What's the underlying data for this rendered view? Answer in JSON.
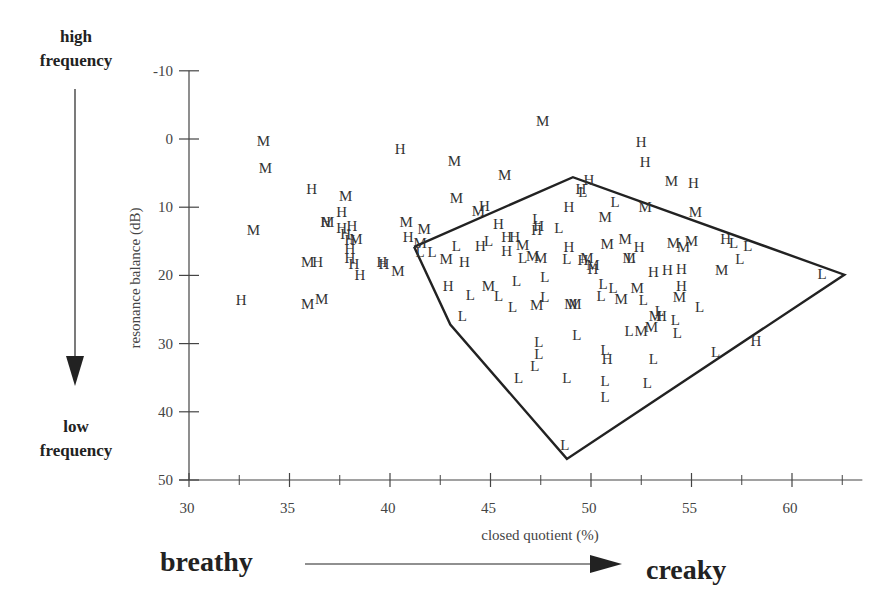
{
  "chart_data": {
    "type": "scatter",
    "title": "",
    "xlabel": "closed quotient (%)",
    "ylabel": "resonance balance (dB)",
    "xlim": [
      30,
      63.5
    ],
    "ylim": [
      -10,
      50
    ],
    "y_inverted": true,
    "grid": false,
    "x_ticks": [
      30,
      35,
      40,
      45,
      50,
      55,
      60
    ],
    "x_tick_labels": [
      "30",
      "35",
      "40",
      "45",
      "50",
      "55",
      "60"
    ],
    "x_minor_ticks": [
      32.5,
      37.5,
      42.5,
      47.5,
      52.5,
      57.5,
      62.5
    ],
    "y_ticks": [
      -10,
      0,
      10,
      20,
      30,
      40,
      50
    ],
    "y_tick_labels": [
      "-10",
      "0",
      "10",
      "20",
      "30",
      "40",
      "50"
    ],
    "marker_type": "text-glyph",
    "legend": {
      "H": "high",
      "M": "mid",
      "L": "low"
    },
    "polygon": {
      "label": "L region hull",
      "vertices": [
        [
          41.2,
          15.8
        ],
        [
          49.1,
          5.6
        ],
        [
          62.6,
          19.9
        ],
        [
          48.8,
          46.9
        ],
        [
          43.0,
          27.2
        ],
        [
          41.2,
          15.8
        ]
      ]
    },
    "series": [
      {
        "name": "H",
        "points": [
          [
            32.6,
            23.6
          ],
          [
            36.1,
            7.4
          ],
          [
            36.8,
            12.2
          ],
          [
            36.4,
            18.0
          ],
          [
            37.6,
            10.7
          ],
          [
            37.6,
            13.0
          ],
          [
            37.8,
            14.0
          ],
          [
            38.1,
            12.8
          ],
          [
            38.0,
            14.8
          ],
          [
            38.0,
            16.2
          ],
          [
            38.0,
            17.4
          ],
          [
            38.2,
            18.4
          ],
          [
            38.5,
            20.0
          ],
          [
            39.7,
            18.3
          ],
          [
            40.5,
            1.4
          ],
          [
            40.9,
            14.3
          ],
          [
            42.9,
            21.6
          ],
          [
            43.7,
            18.0
          ],
          [
            44.5,
            15.7
          ],
          [
            44.7,
            9.8
          ],
          [
            45.4,
            12.4
          ],
          [
            45.8,
            14.4
          ],
          [
            45.8,
            16.4
          ],
          [
            46.2,
            14.4
          ],
          [
            47.4,
            12.7
          ],
          [
            47.3,
            13.3
          ],
          [
            48.9,
            10.0
          ],
          [
            48.9,
            15.9
          ],
          [
            49.5,
            7.3
          ],
          [
            49.9,
            6.0
          ],
          [
            49.6,
            17.8
          ],
          [
            50.1,
            19.0
          ],
          [
            50.8,
            32.2
          ],
          [
            52.5,
            0.5
          ],
          [
            52.7,
            3.3
          ],
          [
            52.4,
            15.8
          ],
          [
            53.1,
            19.5
          ],
          [
            53.8,
            19.2
          ],
          [
            53.5,
            26.0
          ],
          [
            54.5,
            21.6
          ],
          [
            54.5,
            19.0
          ],
          [
            55.1,
            6.4
          ],
          [
            56.7,
            14.6
          ],
          [
            58.2,
            29.6
          ],
          [
            39.6,
            18.0
          ]
        ]
      },
      {
        "name": "M",
        "points": [
          [
            33.7,
            0.3
          ],
          [
            33.8,
            4.3
          ],
          [
            33.2,
            13.3
          ],
          [
            36.9,
            12.2
          ],
          [
            37.8,
            8.4
          ],
          [
            35.9,
            18.1
          ],
          [
            35.9,
            24.2
          ],
          [
            36.6,
            23.4
          ],
          [
            38.3,
            14.6
          ],
          [
            40.4,
            19.3
          ],
          [
            40.8,
            12.2
          ],
          [
            41.7,
            13.2
          ],
          [
            41.5,
            15.2
          ],
          [
            42.8,
            17.6
          ],
          [
            43.2,
            3.2
          ],
          [
            43.3,
            8.6
          ],
          [
            44.4,
            10.6
          ],
          [
            44.9,
            21.6
          ],
          [
            45.7,
            5.3
          ],
          [
            46.6,
            15.5
          ],
          [
            47.1,
            17.2
          ],
          [
            47.5,
            17.4
          ],
          [
            47.3,
            24.3
          ],
          [
            47.6,
            -2.6
          ],
          [
            49.0,
            24.2
          ],
          [
            49.2,
            24.2
          ],
          [
            49.8,
            17.4
          ],
          [
            50.1,
            18.5
          ],
          [
            50.7,
            11.4
          ],
          [
            50.8,
            15.4
          ],
          [
            51.5,
            23.4
          ],
          [
            51.7,
            14.7
          ],
          [
            51.9,
            17.5
          ],
          [
            52.3,
            21.8
          ],
          [
            52.7,
            9.9
          ],
          [
            53.0,
            27.5
          ],
          [
            53.2,
            26.0
          ],
          [
            54.0,
            6.2
          ],
          [
            54.1,
            15.3
          ],
          [
            54.4,
            23.1
          ],
          [
            54.6,
            15.9
          ],
          [
            55.0,
            15.0
          ],
          [
            55.2,
            10.7
          ],
          [
            56.5,
            19.2
          ],
          [
            52.5,
            28.2
          ]
        ]
      },
      {
        "name": "L",
        "points": [
          [
            41.5,
            16.5
          ],
          [
            42.1,
            16.5
          ],
          [
            43.3,
            15.7
          ],
          [
            43.6,
            25.9
          ],
          [
            44.0,
            22.9
          ],
          [
            44.9,
            14.9
          ],
          [
            45.4,
            23.0
          ],
          [
            46.1,
            24.7
          ],
          [
            46.3,
            20.8
          ],
          [
            46.4,
            35.0
          ],
          [
            47.2,
            33.3
          ],
          [
            47.4,
            29.7
          ],
          [
            47.4,
            31.5
          ],
          [
            47.7,
            20.2
          ],
          [
            47.3,
            11.8
          ],
          [
            47.7,
            23.1
          ],
          [
            48.4,
            13.0
          ],
          [
            48.8,
            17.6
          ],
          [
            48.8,
            35.1
          ],
          [
            49.3,
            28.7
          ],
          [
            49.6,
            7.8
          ],
          [
            50.6,
            21.2
          ],
          [
            50.5,
            23.0
          ],
          [
            50.7,
            30.9
          ],
          [
            50.7,
            35.5
          ],
          [
            50.7,
            37.8
          ],
          [
            51.2,
            9.3
          ],
          [
            51.9,
            28.1
          ],
          [
            52.0,
            17.5
          ],
          [
            52.6,
            23.6
          ],
          [
            52.8,
            35.8
          ],
          [
            53.1,
            32.3
          ],
          [
            54.2,
            26.6
          ],
          [
            55.4,
            24.7
          ],
          [
            56.2,
            31.3
          ],
          [
            57.1,
            15.2
          ],
          [
            57.4,
            17.6
          ],
          [
            57.8,
            15.7
          ],
          [
            61.5,
            19.8
          ],
          [
            48.7,
            44.8
          ],
          [
            51.1,
            21.8
          ],
          [
            53.4,
            25.2
          ],
          [
            54.3,
            28.4
          ],
          [
            46.6,
            17.5
          ]
        ]
      }
    ]
  },
  "annotations": {
    "high_frequency": [
      "high",
      "frequency"
    ],
    "low_frequency": [
      "low",
      "frequency"
    ],
    "breathy": "breathy",
    "creaky": "creaky"
  }
}
